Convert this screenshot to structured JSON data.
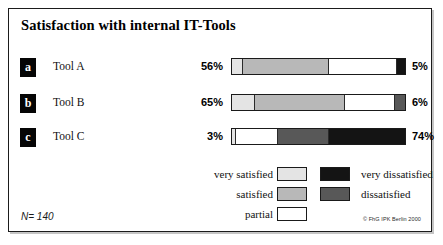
{
  "figure": {
    "title": "Satisfaction with internal IT-Tools",
    "sample_size": "N= 140",
    "copyright": "© FhG IPK Berlin 2000"
  },
  "colors": {
    "very_satisfied": "#e4e4e4",
    "satisfied": "#b8b8b8",
    "partial": "#ffffff",
    "dissatisfied": "#585858",
    "very_dissatisfied": "#141414",
    "border": "#1a1a1a",
    "text": "#111111"
  },
  "legend": {
    "entries": [
      {
        "label": "very satisfied",
        "key": "very_satisfied",
        "column": "left"
      },
      {
        "label": "very dissatisfied",
        "key": "very_dissatisfied",
        "column": "right"
      },
      {
        "label": "satisfied",
        "key": "satisfied",
        "column": "left"
      },
      {
        "label": "dissatisfied",
        "key": "dissatisfied",
        "column": "right"
      },
      {
        "label": "partial",
        "key": "partial",
        "column": "left"
      }
    ],
    "rows": [
      {
        "left_label": "very satisfied",
        "left_key": "very_satisfied",
        "right_label": "very dissatisfied",
        "right_key": "very_dissatisfied"
      },
      {
        "left_label": "satisfied",
        "left_key": "satisfied",
        "right_label": "dissatisfied",
        "right_key": "dissatisfied"
      },
      {
        "left_label": "partial",
        "left_key": "partial",
        "right_label": "",
        "right_key": ""
      }
    ]
  },
  "chart_data": {
    "type": "bar",
    "orientation": "horizontal",
    "stacked": true,
    "normalized_percent": true,
    "title": "Satisfaction with internal IT-Tools",
    "xlabel": "",
    "ylabel": "",
    "xlim": [
      0,
      100
    ],
    "grid": false,
    "legend_position": "bottom-center",
    "annotations": [
      "N= 140",
      "© FhG IPK Berlin 2000"
    ],
    "categories": [
      "Tool A",
      "Tool B",
      "Tool C"
    ],
    "category_badges": [
      "a",
      "b",
      "c"
    ],
    "series": [
      {
        "name": "very satisfied",
        "values": [
          6,
          13,
          2
        ]
      },
      {
        "name": "satisfied",
        "values": [
          50,
          52,
          1
        ]
      },
      {
        "name": "partial",
        "values": [
          39,
          29,
          24
        ]
      },
      {
        "name": "dissatisfied",
        "values": [
          0,
          6,
          29
        ]
      },
      {
        "name": "very dissatisfied",
        "values": [
          5,
          0,
          45
        ]
      }
    ],
    "left_value_labels": [
      "56%",
      "65%",
      "3%"
    ],
    "right_value_labels": [
      "5%",
      "6%",
      "74%"
    ],
    "left_label_meaning": "very satisfied + satisfied",
    "right_label_meaning": "dissatisfied + very dissatisfied"
  },
  "rows": [
    {
      "badge": "a",
      "label": "Tool A",
      "left_value": "56%",
      "right_value": "5%",
      "segments": [
        {
          "key": "very_satisfied",
          "pct": 6
        },
        {
          "key": "satisfied",
          "pct": 50
        },
        {
          "key": "partial",
          "pct": 39
        },
        {
          "key": "very_dissatisfied",
          "pct": 5
        }
      ]
    },
    {
      "badge": "b",
      "label": "Tool B",
      "left_value": "65%",
      "right_value": "6%",
      "segments": [
        {
          "key": "very_satisfied",
          "pct": 13
        },
        {
          "key": "satisfied",
          "pct": 52
        },
        {
          "key": "partial",
          "pct": 29
        },
        {
          "key": "dissatisfied",
          "pct": 6
        }
      ]
    },
    {
      "badge": "c",
      "label": "Tool C",
      "left_value": "3%",
      "right_value": "74%",
      "segments": [
        {
          "key": "very_satisfied",
          "pct": 2
        },
        {
          "key": "partial",
          "pct": 24
        },
        {
          "key": "dissatisfied",
          "pct": 29
        },
        {
          "key": "very_dissatisfied",
          "pct": 45
        }
      ]
    }
  ]
}
